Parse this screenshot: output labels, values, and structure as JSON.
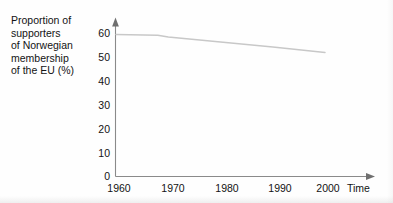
{
  "chart_data": {
    "type": "line",
    "title": "",
    "subtitle": "",
    "ylabel": "Proportion of\nsupporters\nof Norwegian\nmembership\nof the EU (%)",
    "xlabel": "Time",
    "ylim": [
      0,
      62
    ],
    "xlim": [
      1957,
      2004
    ],
    "ytick_values": [
      0,
      10,
      20,
      30,
      40,
      50,
      60
    ],
    "ytick_labels": [
      "0",
      "10",
      "20",
      "30",
      "40",
      "50",
      "60"
    ],
    "xtick_values": [
      1960,
      1970,
      1980,
      1990,
      2000
    ],
    "xtick_labels": [
      "1960",
      "1970",
      "1980",
      "1990",
      "2000"
    ],
    "grid": false,
    "legend": false,
    "legend_position": "none",
    "series": [
      {
        "name": "Proportion of supporters of Norwegian membership of the EU (%)",
        "color": "#c8c8c8",
        "x": [
          1960,
          1968,
          1970,
          1980,
          1990,
          2000
        ],
        "values": [
          59.5,
          59.2,
          58.5,
          56.3,
          54.2,
          52.0
        ]
      }
    ],
    "annotations": [],
    "axis_arrow_x": true,
    "axis_arrow_y": true,
    "axis_color": "#8a8a8a",
    "line_color": "#c8c8c8",
    "background": "#fefefe"
  }
}
